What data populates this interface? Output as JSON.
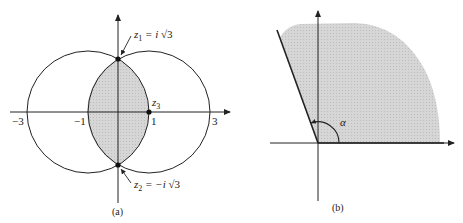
{
  "figure": {
    "panel_a": {
      "caption": "(a)",
      "axis_ticks": {
        "neg3": "−3",
        "neg1": "−1",
        "pos1": "1",
        "pos3": "3"
      },
      "points": {
        "z1": {
          "sym": "z",
          "sub": "1",
          "eq": " = i ",
          "root": "√3"
        },
        "z2": {
          "sym": "z",
          "sub": "2",
          "eq": " = −i ",
          "root": "√3"
        },
        "z3": {
          "sym": "z",
          "sub": "3"
        }
      },
      "description": "Two circles |z+1|=2 and |z-1|=2; lens-shaped intersection shaded"
    },
    "panel_b": {
      "caption": "(b)",
      "angle_label": "α",
      "description": "Sector of angle alpha from positive real axis, shaded"
    },
    "colors": {
      "ink": "#222222",
      "shade": "#d2d2d2",
      "background": "#ffffff"
    }
  }
}
